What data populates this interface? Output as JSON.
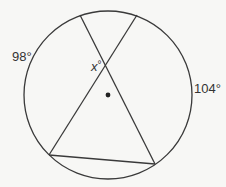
{
  "diagram": {
    "type": "circle with inscribed chords",
    "labels": {
      "arc_left": "98°",
      "arc_right": "104°",
      "angle_var": "x",
      "angle_deg": "°"
    },
    "circle": {
      "cx": 108,
      "cy": 95,
      "r": 84
    },
    "center_dot": {
      "x": 108,
      "y": 95
    },
    "points": {
      "top_left": [
        80,
        15
      ],
      "top_right": [
        137,
        15
      ],
      "bottom_left": [
        49,
        155
      ],
      "bottom_right": [
        155,
        164
      ]
    },
    "stroke_color": "#3a3a3a"
  }
}
